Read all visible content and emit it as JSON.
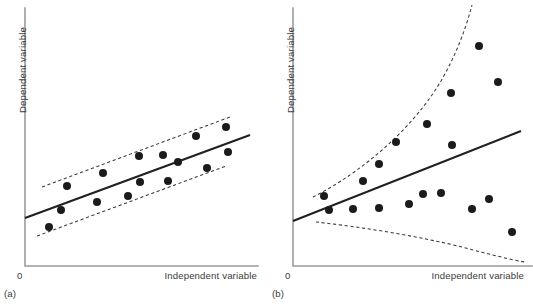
{
  "figure": {
    "background_color": "#ffffff",
    "dot_color": "#1c1a1b",
    "fit_line_color": "#231f20",
    "band_line_color": "#3a3a3a",
    "axis_color": "#9b9b9b",
    "text_color": "#3c3a3b"
  },
  "panels": [
    {
      "id": "a",
      "caption": "(a)",
      "origin_label": "0",
      "x_axis_label": "Independent variable",
      "y_axis_label": "Dependent variable",
      "axis": {
        "x0": 25,
        "y0": 266,
        "x1": 258,
        "y_top": 8
      },
      "chart_data": {
        "type": "scatter",
        "title": "Homoscedastic scatter (constant variance)",
        "xlabel": "Independent variable",
        "ylabel": "Dependent variable",
        "xlim": [
          25,
          258
        ],
        "ylim": [
          8,
          266
        ],
        "grid": false,
        "legend": "none",
        "points": [
          {
            "x": 49,
            "y": 227
          },
          {
            "x": 61,
            "y": 210
          },
          {
            "x": 67,
            "y": 186
          },
          {
            "x": 97,
            "y": 202
          },
          {
            "x": 103,
            "y": 173
          },
          {
            "x": 128,
            "y": 196
          },
          {
            "x": 139,
            "y": 156
          },
          {
            "x": 140,
            "y": 182
          },
          {
            "x": 163,
            "y": 155
          },
          {
            "x": 168,
            "y": 181
          },
          {
            "x": 178,
            "y": 162
          },
          {
            "x": 196,
            "y": 136
          },
          {
            "x": 207,
            "y": 168
          },
          {
            "x": 226,
            "y": 127
          },
          {
            "x": 228,
            "y": 152
          }
        ],
        "fit_line": {
          "x0": 25,
          "y0": 218,
          "x1": 250,
          "y1": 135
        },
        "bands": {
          "upper": {
            "x0": 42,
            "y0": 187,
            "x1": 230,
            "y1": 117
          },
          "lower": {
            "x0": 37,
            "y0": 236,
            "x1": 226,
            "y1": 166
          }
        }
      }
    },
    {
      "id": "b",
      "caption": "(b)",
      "origin_label": "0",
      "x_axis_label": "Independent variable",
      "y_axis_label": "Dependent variable",
      "axis": {
        "x0": 26,
        "y0": 266,
        "x1": 265,
        "y_top": 8
      },
      "chart_data": {
        "type": "scatter",
        "title": "Heteroscedastic scatter (fanning variance)",
        "xlabel": "Independent variable",
        "ylabel": "Dependent variable",
        "xlim": [
          26,
          265
        ],
        "ylim": [
          8,
          266
        ],
        "grid": false,
        "legend": "none",
        "points": [
          {
            "x": 57,
            "y": 196
          },
          {
            "x": 62,
            "y": 210
          },
          {
            "x": 86,
            "y": 209
          },
          {
            "x": 96,
            "y": 181
          },
          {
            "x": 112,
            "y": 208
          },
          {
            "x": 112,
            "y": 164
          },
          {
            "x": 129,
            "y": 142
          },
          {
            "x": 142,
            "y": 204
          },
          {
            "x": 156,
            "y": 194
          },
          {
            "x": 160,
            "y": 124
          },
          {
            "x": 174,
            "y": 193
          },
          {
            "x": 184,
            "y": 93
          },
          {
            "x": 185,
            "y": 145
          },
          {
            "x": 205,
            "y": 209
          },
          {
            "x": 212,
            "y": 46
          },
          {
            "x": 222,
            "y": 199
          },
          {
            "x": 231,
            "y": 82
          },
          {
            "x": 245,
            "y": 232
          }
        ],
        "fit_line": {
          "x0": 26,
          "y0": 221,
          "x1": 254,
          "y1": 131
        },
        "bands": {
          "upper_curve": "fans upward steeply from (46,197) to (205,5)",
          "lower_curve": "fans downward from (49,222) to (258,262)"
        }
      }
    }
  ]
}
